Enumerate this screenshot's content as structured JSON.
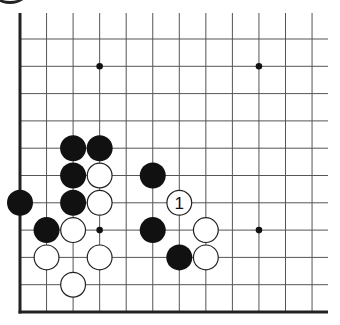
{
  "board": {
    "origin": {
      "x": 20,
      "y": 39
    },
    "spacing_x": 26.55,
    "spacing_y": 27.3,
    "columns": 12,
    "rows_below_origin": 10,
    "top_open_y": 13,
    "right_open_x": 328,
    "edges": [
      "left",
      "bottom"
    ],
    "line_color": "#555555",
    "edge_color": "#222222"
  },
  "hoshi": [
    {
      "col": 3,
      "row": 1
    },
    {
      "col": 9,
      "row": 1
    },
    {
      "col": 3,
      "row": 7
    },
    {
      "col": 9,
      "row": 7
    }
  ],
  "stones": [
    {
      "color": "black",
      "col": 2,
      "row": 4
    },
    {
      "color": "black",
      "col": 3,
      "row": 4
    },
    {
      "color": "black",
      "col": 2,
      "row": 5
    },
    {
      "color": "white",
      "col": 3,
      "row": 5
    },
    {
      "color": "black",
      "col": 5,
      "row": 5
    },
    {
      "color": "black",
      "col": 0,
      "row": 6
    },
    {
      "color": "black",
      "col": 2,
      "row": 6
    },
    {
      "color": "white",
      "col": 3,
      "row": 6
    },
    {
      "color": "white",
      "col": 6,
      "row": 6,
      "label": "1"
    },
    {
      "color": "black",
      "col": 1,
      "row": 7
    },
    {
      "color": "white",
      "col": 2,
      "row": 7
    },
    {
      "color": "black",
      "col": 5,
      "row": 7
    },
    {
      "color": "white",
      "col": 7,
      "row": 7
    },
    {
      "color": "white",
      "col": 1,
      "row": 8
    },
    {
      "color": "white",
      "col": 3,
      "row": 8
    },
    {
      "color": "black",
      "col": 6,
      "row": 8
    },
    {
      "color": "white",
      "col": 7,
      "row": 8
    },
    {
      "color": "white",
      "col": 2,
      "row": 9
    }
  ]
}
